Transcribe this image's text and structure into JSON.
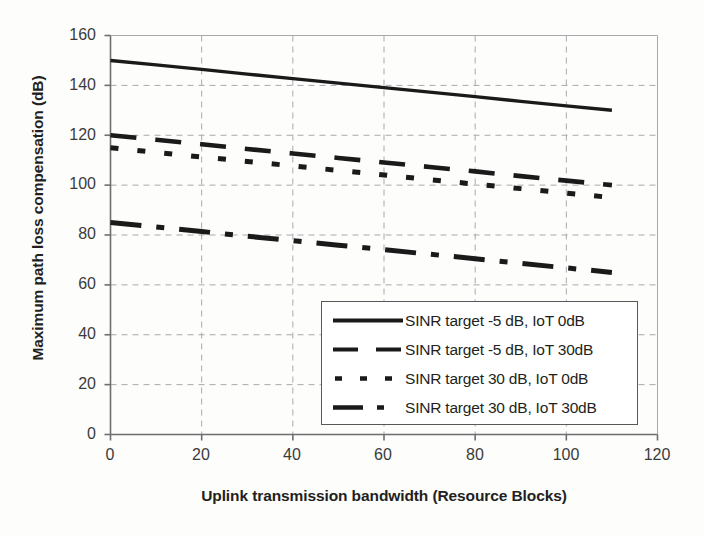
{
  "chart_data": {
    "type": "line",
    "title": "",
    "xlabel": "Uplink transmission bandwidth (Resource Blocks)",
    "ylabel": "Maximum path loss compensation (dB)",
    "xlim": [
      0,
      120
    ],
    "ylim": [
      0,
      160
    ],
    "xticks": [
      0,
      20,
      40,
      60,
      80,
      100,
      120
    ],
    "yticks": [
      0,
      20,
      40,
      60,
      80,
      100,
      120,
      140,
      160
    ],
    "xtick_labels": [
      "0",
      "20",
      "40",
      "60",
      "80",
      "100",
      "120"
    ],
    "ytick_labels": [
      "0",
      "20",
      "40",
      "60",
      "80",
      "100",
      "120",
      "140",
      "160"
    ],
    "grid": "dashed-both-axes",
    "legend_position": "lower-right-inside",
    "x": [
      0,
      10,
      20,
      30,
      40,
      50,
      60,
      70,
      80,
      90,
      100,
      110
    ],
    "series": [
      {
        "name": "SINR target -5 dB, IoT 0dB",
        "style": "solid",
        "color": "#1a1a1a",
        "values": [
          150.0,
          148.2,
          146.4,
          144.5,
          142.7,
          140.9,
          139.1,
          137.3,
          135.5,
          133.6,
          131.8,
          130.0
        ]
      },
      {
        "name": "SINR target -5 dB, IoT 30dB",
        "style": "dashed",
        "color": "#1a1a1a",
        "values": [
          120.0,
          118.2,
          116.4,
          114.5,
          112.7,
          110.9,
          109.1,
          107.3,
          105.5,
          103.6,
          101.8,
          100.0
        ]
      },
      {
        "name": "SINR target 30 dB, IoT 0dB",
        "style": "dotted",
        "color": "#1a1a1a",
        "values": [
          115.0,
          113.1,
          111.3,
          109.5,
          107.7,
          105.9,
          104.1,
          102.2,
          100.4,
          98.6,
          96.8,
          95.0
        ]
      },
      {
        "name": "SINR target 30 dB, IoT 30dB",
        "style": "dash-dot",
        "color": "#1a1a1a",
        "values": [
          85.0,
          83.2,
          81.4,
          79.5,
          77.7,
          75.9,
          74.1,
          72.3,
          70.5,
          68.6,
          66.8,
          65.0
        ]
      }
    ]
  },
  "axes": {
    "x_title": "Uplink transmission bandwidth (Resource Blocks)",
    "y_title": "Maximum path loss compensation (dB)"
  },
  "legend": {
    "entries": [
      {
        "label": "SINR target -5 dB, IoT 0dB",
        "style": "solid"
      },
      {
        "label": "SINR target -5 dB, IoT 30dB",
        "style": "dashed"
      },
      {
        "label": "SINR target 30 dB, IoT 0dB",
        "style": "dotted"
      },
      {
        "label": "SINR target 30 dB, IoT 30dB",
        "style": "dash-dot"
      }
    ]
  },
  "colors": {
    "line": "#1a1a1a",
    "axis": "#6d6e70",
    "grid": "#a7a9ac",
    "text": "#231f20",
    "background": "#fdfdfc"
  }
}
